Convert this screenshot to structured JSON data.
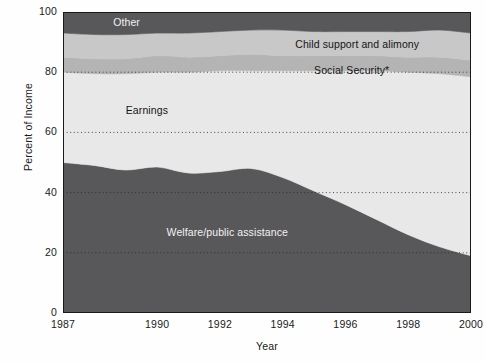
{
  "chart_data": {
    "type": "area",
    "stacked": true,
    "title": "",
    "xlabel": "Year",
    "ylabel": "Percent of Income",
    "xlim": [
      1987,
      2000
    ],
    "ylim": [
      0,
      100
    ],
    "xticks": [
      "1987",
      "1990",
      "1992",
      "1994",
      "1996",
      "1998",
      "2000"
    ],
    "xtick_values": [
      1987,
      1990,
      1992,
      1994,
      1996,
      1998,
      2000
    ],
    "yticks": [
      "0",
      "20",
      "40",
      "60",
      "80",
      "100"
    ],
    "ytick_values": [
      0,
      20,
      40,
      60,
      80,
      100
    ],
    "grid": "horizontal-dotted",
    "gridlines": [
      20,
      40,
      60,
      80
    ],
    "legend_position": "inline-labels",
    "x": [
      1987,
      1988,
      1989,
      1990,
      1991,
      1992,
      1993,
      1994,
      1995,
      1996,
      1997,
      1998,
      1999,
      2000
    ],
    "series": [
      {
        "name": "Welfare/public assistance",
        "color": "#58585a",
        "label_color": "#f2f2f2",
        "values": [
          50,
          49,
          47.5,
          48.5,
          46.5,
          47,
          48,
          45,
          40.5,
          36,
          31,
          26,
          22,
          19
        ]
      },
      {
        "name": "Earnings",
        "color": "#e8e8e8",
        "label_color": "#141414",
        "values": [
          30,
          30.5,
          32,
          31.5,
          33.5,
          33.5,
          32.5,
          35.5,
          40,
          44.5,
          49.5,
          54,
          57.5,
          59.5
        ]
      },
      {
        "name": "Social Security*",
        "color": "#b4b4b4",
        "label_color": "#141414",
        "values": [
          5,
          5,
          5,
          5.5,
          5,
          5,
          5.5,
          5,
          5,
          5,
          5,
          5,
          5.5,
          5.5
        ]
      },
      {
        "name": "Child support and alimony",
        "color": "#c8c8c8",
        "label_color": "#141414",
        "values": [
          8,
          8,
          8,
          7.5,
          8,
          8,
          8,
          8.5,
          8,
          8,
          8,
          8.5,
          9,
          9
        ]
      },
      {
        "name": "Other",
        "color": "#58585a",
        "label_color": "#f2f2f2",
        "values": [
          7,
          7.5,
          7.5,
          7,
          7,
          6.5,
          6,
          6,
          6.5,
          6.5,
          6.5,
          6.5,
          6,
          7
        ]
      }
    ],
    "annotations": [
      {
        "text": "Other",
        "x": 1988.6,
        "y": 96.3,
        "style": "light"
      },
      {
        "text": "Child support and alimony",
        "x": 1994.4,
        "y": 89.2,
        "style": "dark"
      },
      {
        "text": "Social Security*",
        "x": 1995.0,
        "y": 80.4,
        "style": "dark"
      },
      {
        "text": "Earnings",
        "x": 1989.0,
        "y": 67.0,
        "style": "dark"
      },
      {
        "text": "Welfare/public assistance",
        "x": 1990.3,
        "y": 26.5,
        "style": "light"
      }
    ],
    "footnote": "*"
  }
}
